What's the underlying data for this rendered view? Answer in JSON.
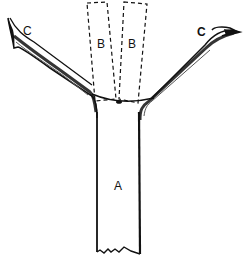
{
  "figure": {
    "type": "line-drawing",
    "labels": {
      "trunk": "A",
      "dashed_left": "B",
      "dashed_right": "B",
      "branch_left": "C",
      "branch_right": "C"
    },
    "colors": {
      "ink": "#111111",
      "background": "#ffffff"
    }
  }
}
